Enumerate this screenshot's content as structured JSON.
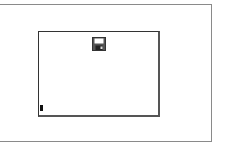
{
  "window": {
    "title": ""
  },
  "canvas": {
    "text_value": ""
  },
  "icons": {
    "save": "floppy-disk-icon"
  },
  "colors": {
    "border": "#333333",
    "frame": "#8a8a8a",
    "background": "#ffffff"
  }
}
